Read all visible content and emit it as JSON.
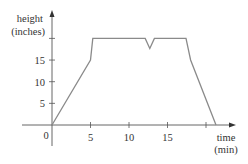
{
  "chart_data": {
    "type": "line",
    "title": "",
    "xlabel": "time (min)",
    "xlabel_lines": [
      "time",
      "(min)"
    ],
    "ylabel": "height (inches)",
    "ylabel_lines": [
      "height",
      "(inches)"
    ],
    "origin_label": "0",
    "xlim": [
      0,
      23
    ],
    "ylim": [
      0,
      22
    ],
    "x_ticks": [
      5,
      10,
      15,
      20
    ],
    "x_tick_labels": [
      "5",
      "10",
      "15",
      ""
    ],
    "y_ticks": [
      5,
      10,
      15,
      20
    ],
    "y_tick_labels": [
      "5",
      "10",
      "15",
      ""
    ],
    "grid": false,
    "legend": null,
    "series": [
      {
        "name": "height",
        "color": "#8a8a8a",
        "points": [
          [
            0,
            0
          ],
          [
            5,
            15
          ],
          [
            5.3,
            20
          ],
          [
            12.1,
            20
          ],
          [
            12.7,
            17.7
          ],
          [
            13.3,
            20
          ],
          [
            17.4,
            20
          ],
          [
            18,
            15
          ],
          [
            21.3,
            0
          ]
        ]
      }
    ],
    "axis_color": "#555555"
  }
}
